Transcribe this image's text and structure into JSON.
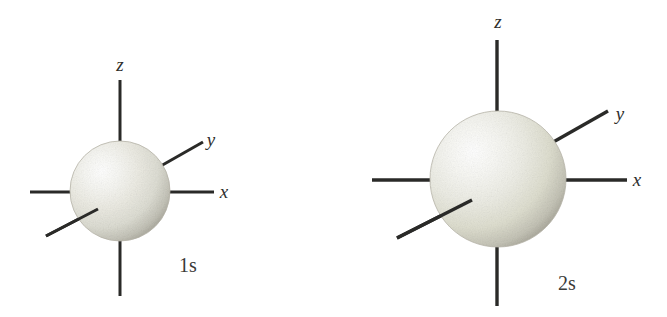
{
  "figure": {
    "background_color": "#ffffff",
    "axis_color": "#2a2a28",
    "label_color": "#2e2e2c",
    "sphere_highlight_color": "#fdfdfc",
    "sphere_mid_color": "#e3e2da",
    "sphere_edge_color": "#a9a79c",
    "orbitals": [
      {
        "id": "orbital-1s",
        "caption": "1s",
        "caption_x": 188,
        "caption_y": 272,
        "caption_font_size": 20,
        "center_x": 120,
        "center_y": 191,
        "radius": 50,
        "axis_labels": {
          "z": "z",
          "x": "x",
          "y": "y"
        },
        "z_label_x": 120,
        "z_label_y": 71,
        "x_label_x": 224,
        "x_label_y": 198,
        "y_label_x": 211,
        "y_label_y": 146
      },
      {
        "id": "orbital-2s",
        "caption": "2s",
        "caption_x": 567,
        "caption_y": 290,
        "caption_font_size": 20,
        "center_x": 498,
        "center_y": 179,
        "radius": 68,
        "axis_labels": {
          "z": "z",
          "x": "x",
          "y": "y"
        },
        "z_label_x": 498,
        "z_label_y": 28,
        "x_label_x": 637,
        "x_label_y": 186,
        "y_label_x": 620,
        "y_label_y": 120
      }
    ]
  }
}
